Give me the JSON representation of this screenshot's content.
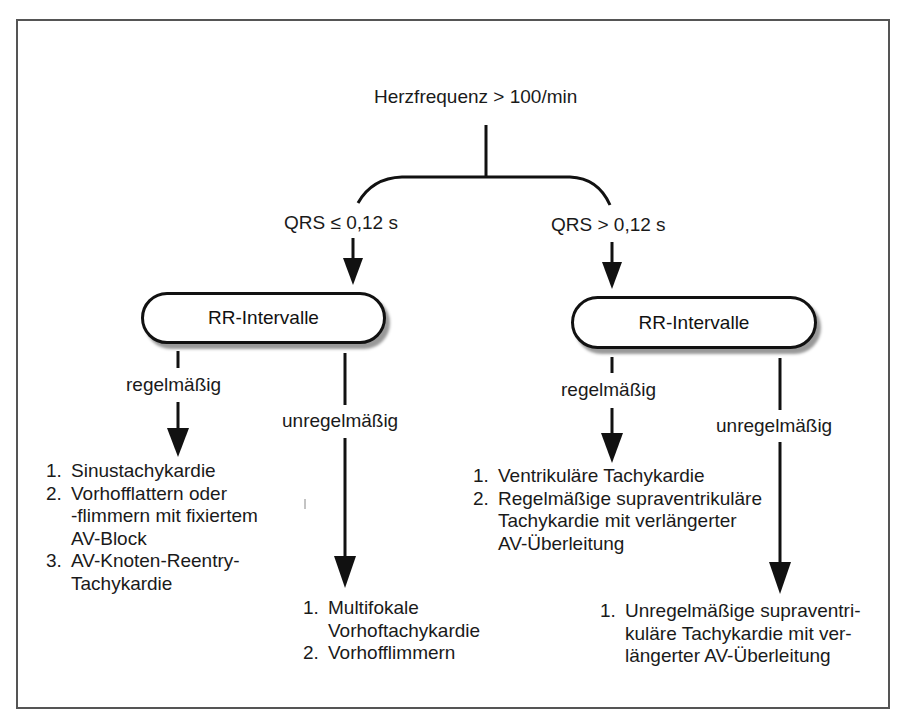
{
  "diagram": {
    "root": {
      "label": "Herzfrequenz > 100/min"
    },
    "branches": [
      {
        "condition": "QRS ≤ 0,12 s",
        "node": "RR-Intervalle",
        "regular": {
          "label": "regelmäßig",
          "items": [
            {
              "num": "1.",
              "text": "Sinustachykardie"
            },
            {
              "num": "2.",
              "text": "Vorhofflattern oder\n-flimmern mit fixiertem\nAV-Block"
            },
            {
              "num": "3.",
              "text": "AV-Knoten-Reentry-\nTachykardie"
            }
          ]
        },
        "irregular": {
          "label": "unregelmäßig",
          "items": [
            {
              "num": "1.",
              "text": "Multifokale\nVorhoftachykardie"
            },
            {
              "num": "2.",
              "text": "Vorhofflimmern"
            }
          ]
        }
      },
      {
        "condition": "QRS > 0,12 s",
        "node": "RR-Intervalle",
        "regular": {
          "label": "regelmäßig",
          "items": [
            {
              "num": "1.",
              "text": "Ventrikuläre Tachykardie"
            },
            {
              "num": "2.",
              "text": "Regelmäßige supraventrikuläre\nTachykardie mit verlängerter\nAV-Überleitung"
            }
          ]
        },
        "irregular": {
          "label": "unregelmäßig",
          "items": [
            {
              "num": "1.",
              "text": "Unregelmäßige supraventri-\nkuläre Tachykardie mit ver-\nlängerter AV-Überleitung"
            }
          ]
        }
      }
    ]
  }
}
